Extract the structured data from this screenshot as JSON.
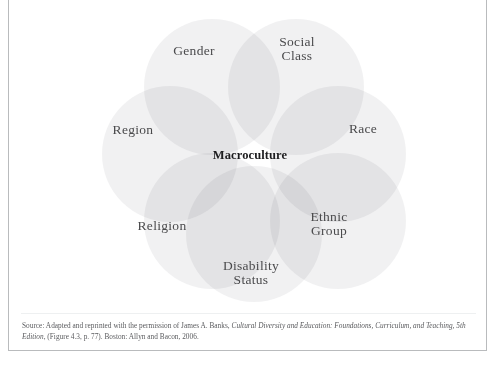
{
  "figure": {
    "diagram_type": "seven-circle-venn-rosette",
    "center": {
      "label": "Macroculture"
    },
    "circles": [
      {
        "id": "gender",
        "label": "Gender",
        "cx": 203,
        "cy": 88,
        "r": 68
      },
      {
        "id": "social-class",
        "label": "Social\nClass",
        "cx": 287,
        "cy": 88,
        "r": 68
      },
      {
        "id": "region",
        "label": "Region",
        "cx": 161,
        "cy": 155,
        "r": 68
      },
      {
        "id": "race",
        "label": "Race",
        "cx": 329,
        "cy": 155,
        "r": 68
      },
      {
        "id": "religion",
        "label": "Religion",
        "cx": 203,
        "cy": 222,
        "r": 68
      },
      {
        "id": "ethnic-group",
        "label": "Ethnic\nGroup",
        "cx": 329,
        "cy": 222,
        "r": 68
      },
      {
        "id": "disability-status",
        "label": "Disability\nStatus",
        "cx": 245,
        "cy": 235,
        "r": 68
      }
    ],
    "label_positions": [
      {
        "id": "gender",
        "x": 185,
        "y": 52
      },
      {
        "id": "social-class",
        "x": 288,
        "y": 50
      },
      {
        "id": "region",
        "x": 124,
        "y": 131
      },
      {
        "id": "race",
        "x": 354,
        "y": 130
      },
      {
        "id": "religion",
        "x": 153,
        "y": 227
      },
      {
        "id": "ethnic-group",
        "x": 320,
        "y": 225
      },
      {
        "id": "disability-status",
        "x": 242,
        "y": 274
      },
      {
        "id": "macroculture",
        "x": 241,
        "y": 156
      }
    ],
    "colors": {
      "circle_fill": "#e8e9ea",
      "circle_stroke": "none",
      "background": "#ffffff",
      "label_text": "#4a4a4c",
      "center_text": "#1d1d1f",
      "frame_border": "#b9bbbd",
      "divider": "#eef0f1"
    }
  },
  "source": {
    "prefix": "Source: Adapted and reprinted with the permission of James A. Banks, ",
    "title_italic": "Cultural Diversity and Education: Foundations, Curriculum, and Teaching, 5th Edition",
    "suffix": ", (Figure 4.3, p. 77). Boston: Allyn and Bacon, 2006."
  }
}
